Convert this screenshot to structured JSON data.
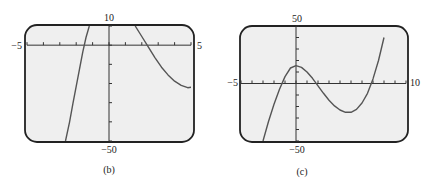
{
  "chart_data": [
    {
      "type": "line",
      "caption": "(b)",
      "title": "",
      "xlabel": "",
      "ylabel": "",
      "xlim": [
        -5,
        5
      ],
      "ylim": [
        -50,
        10
      ],
      "x_tick_step": 1,
      "y_tick_step": 10,
      "x_min_label": "−5",
      "x_max_label": "5",
      "y_max_label": "10",
      "y_min_label": "−50",
      "grid": false,
      "series": [
        {
          "name": "left-branch",
          "x": [
            -2.65,
            -2.4,
            -2.2,
            -2.0,
            -1.8,
            -1.6,
            -1.4,
            -1.2
          ],
          "y": [
            -50,
            -40,
            -30.5,
            -21.5,
            -12.5,
            -3.5,
            4,
            10
          ]
        },
        {
          "name": "right-branch",
          "x": [
            1.6,
            2.0,
            2.4,
            2.8,
            3.2,
            3.6,
            4.0,
            4.4,
            4.8,
            5.0
          ],
          "y": [
            10,
            4.5,
            -1,
            -6.5,
            -11.5,
            -15.5,
            -18.8,
            -21,
            -22.2,
            -22
          ]
        }
      ]
    },
    {
      "type": "line",
      "caption": "(c)",
      "title": "",
      "xlabel": "",
      "ylabel": "",
      "xlim": [
        -5,
        10
      ],
      "ylim": [
        -50,
        50
      ],
      "x_tick_step": 1,
      "y_tick_step": 10,
      "x_min_label": "−5",
      "x_max_label": "10",
      "y_max_label": "50",
      "y_min_label": "−50",
      "grid": false,
      "series": [
        {
          "name": "cubic",
          "x": [
            -3.0,
            -2.5,
            -2.0,
            -1.5,
            -1.0,
            -0.5,
            0.0,
            0.5,
            1.0,
            1.5,
            2.0,
            2.5,
            3.0,
            3.5,
            4.0,
            4.5,
            5.0,
            5.5,
            6.0,
            6.5,
            7.0,
            7.5,
            8.0
          ],
          "y": [
            -50,
            -33,
            -18,
            -5,
            6,
            13.5,
            15.5,
            14,
            10,
            4.5,
            -2,
            -8.5,
            -14.5,
            -19.5,
            -23,
            -25,
            -25,
            -22.5,
            -17,
            -8.5,
            4,
            20,
            40
          ]
        }
      ]
    }
  ]
}
